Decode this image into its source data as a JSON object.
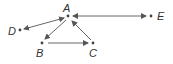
{
  "diagram": {
    "type": "directed-graph",
    "colors": {
      "edge": "#555555",
      "node": "#444444",
      "label": "#333333"
    },
    "nodes": [
      {
        "id": "A",
        "label": "A",
        "x": 68,
        "y": 16
      },
      {
        "id": "B",
        "label": "B",
        "x": 42,
        "y": 43
      },
      {
        "id": "C",
        "label": "C",
        "x": 93,
        "y": 43
      },
      {
        "id": "D",
        "label": "D",
        "x": 20,
        "y": 30
      },
      {
        "id": "E",
        "label": "E",
        "x": 151,
        "y": 16
      }
    ],
    "edges": [
      {
        "from": "A",
        "to": "D",
        "bidirectional": true
      },
      {
        "from": "A",
        "to": "B",
        "bidirectional": false
      },
      {
        "from": "B",
        "to": "C",
        "bidirectional": false
      },
      {
        "from": "C",
        "to": "A",
        "bidirectional": false
      },
      {
        "from": "A",
        "to": "E",
        "bidirectional": true
      }
    ]
  }
}
